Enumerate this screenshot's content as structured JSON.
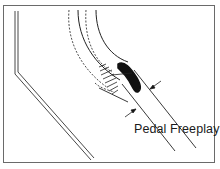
{
  "diagram": {
    "title": "",
    "labels": {
      "pedal_freeplay": "Pedal Freeplay"
    },
    "elements": {
      "pedal_pad": "black pedal pad",
      "pedal_arm": "curved pedal arm (solid and dashed positions)",
      "floor_panel": "double-line floor/firewall outline",
      "dimension": "freeplay dimension arrows between two parallel lines"
    },
    "colors": {
      "line": "#222222",
      "frame": "#6a6a6a",
      "background": "#ffffff"
    }
  }
}
